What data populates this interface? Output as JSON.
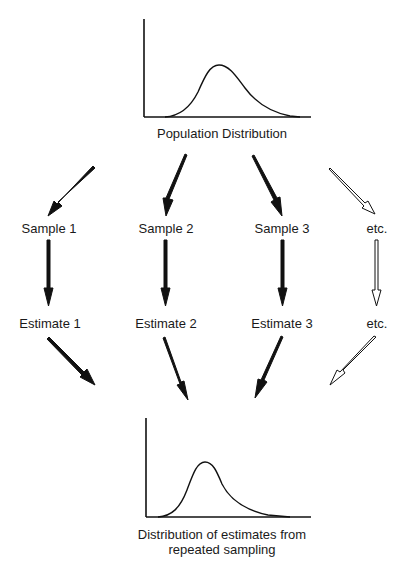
{
  "population": {
    "label": "Population Distribution"
  },
  "samples": [
    {
      "label": "Sample 1"
    },
    {
      "label": "Sample 2"
    },
    {
      "label": "Sample 3"
    },
    {
      "label": "etc."
    }
  ],
  "estimates": [
    {
      "label": "Estimate 1"
    },
    {
      "label": "Estimate 2"
    },
    {
      "label": "Estimate 3"
    },
    {
      "label": "etc."
    }
  ],
  "sampling_distribution": {
    "label_line1": "Distribution of estimates from",
    "label_line2": "repeated sampling"
  },
  "colors": {
    "ink": "#111111",
    "background": "#ffffff"
  }
}
